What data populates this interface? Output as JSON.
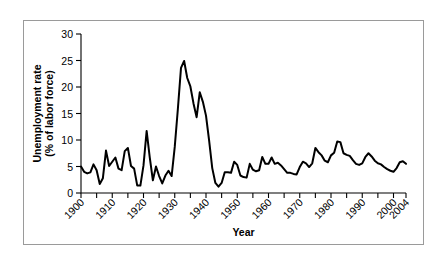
{
  "chart_data": {
    "type": "line",
    "title": "",
    "xlabel": "Year",
    "ylabel": "Unemployment rate\n(% of labor force)",
    "ylabel_line1": "Unemployment rate",
    "ylabel_line2": "(% of labor force)",
    "xlim": [
      1900,
      2004
    ],
    "ylim": [
      0,
      30
    ],
    "yticks": [
      0,
      5,
      10,
      15,
      20,
      25,
      30
    ],
    "ytick_labels": [
      "0",
      "5",
      "10",
      "15",
      "20",
      "25",
      "30"
    ],
    "xticks": [
      1900,
      1905,
      1910,
      1915,
      1920,
      1925,
      1930,
      1935,
      1940,
      1945,
      1950,
      1955,
      1960,
      1965,
      1970,
      1975,
      1980,
      1985,
      1990,
      1995,
      2000,
      2004
    ],
    "xtick_labels_shown": [
      "1900",
      "1910",
      "1920",
      "1930",
      "1940",
      "1950",
      "1960",
      "1970",
      "1980",
      "1990",
      "2000",
      "2004"
    ],
    "xtick_label_years": [
      1900,
      1910,
      1920,
      1930,
      1940,
      1950,
      1960,
      1970,
      1980,
      1990,
      2000,
      2004
    ],
    "xtick_label_rotation_deg": -45,
    "grid": false,
    "legend": false,
    "line_color": "#000000",
    "series": [
      {
        "name": "Unemployment rate (% of labor force)",
        "x": [
          1900,
          1901,
          1902,
          1903,
          1904,
          1905,
          1906,
          1907,
          1908,
          1909,
          1910,
          1911,
          1912,
          1913,
          1914,
          1915,
          1916,
          1917,
          1918,
          1919,
          1920,
          1921,
          1922,
          1923,
          1924,
          1925,
          1926,
          1927,
          1928,
          1929,
          1930,
          1931,
          1932,
          1933,
          1934,
          1935,
          1936,
          1937,
          1938,
          1939,
          1940,
          1941,
          1942,
          1943,
          1944,
          1945,
          1946,
          1947,
          1948,
          1949,
          1950,
          1951,
          1952,
          1953,
          1954,
          1955,
          1956,
          1957,
          1958,
          1959,
          1960,
          1961,
          1962,
          1963,
          1964,
          1965,
          1966,
          1967,
          1968,
          1969,
          1970,
          1971,
          1972,
          1973,
          1974,
          1975,
          1976,
          1977,
          1978,
          1979,
          1980,
          1981,
          1982,
          1983,
          1984,
          1985,
          1986,
          1987,
          1988,
          1989,
          1990,
          1991,
          1992,
          1993,
          1994,
          1995,
          1996,
          1997,
          1998,
          1999,
          2000,
          2001,
          2002,
          2003,
          2004
        ],
        "values": [
          5.0,
          4.0,
          3.7,
          3.9,
          5.4,
          4.3,
          1.7,
          2.8,
          8.0,
          5.1,
          5.9,
          6.7,
          4.6,
          4.3,
          7.9,
          8.5,
          5.1,
          4.6,
          1.4,
          1.4,
          5.2,
          11.7,
          6.7,
          2.4,
          5.0,
          3.2,
          1.8,
          3.3,
          4.2,
          3.2,
          8.7,
          15.9,
          23.6,
          24.9,
          21.7,
          20.1,
          16.9,
          14.3,
          19.0,
          17.2,
          14.6,
          9.9,
          4.7,
          1.9,
          1.2,
          1.9,
          3.9,
          3.9,
          3.8,
          5.9,
          5.3,
          3.3,
          3.0,
          2.9,
          5.5,
          4.4,
          4.1,
          4.3,
          6.8,
          5.5,
          5.5,
          6.7,
          5.5,
          5.7,
          5.2,
          4.5,
          3.8,
          3.8,
          3.6,
          3.5,
          4.9,
          5.9,
          5.6,
          4.9,
          5.6,
          8.5,
          7.7,
          7.1,
          6.1,
          5.8,
          7.1,
          7.6,
          9.7,
          9.6,
          7.5,
          7.2,
          7.0,
          6.2,
          5.5,
          5.3,
          5.6,
          6.8,
          7.5,
          6.9,
          6.1,
          5.6,
          5.4,
          4.9,
          4.5,
          4.2,
          4.0,
          4.7,
          5.8,
          6.0,
          5.5
        ]
      }
    ]
  }
}
